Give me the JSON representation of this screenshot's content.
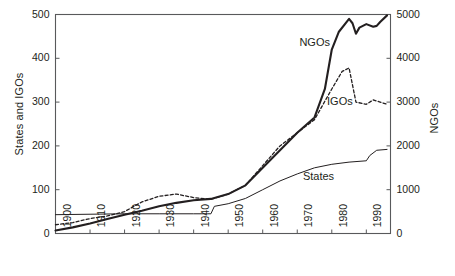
{
  "chart_data": {
    "type": "line",
    "title": "",
    "subtitle": "",
    "xlabel": "",
    "ylabel": "States and IGOs",
    "y2label": "NGOs",
    "grid": false,
    "legend_position": "inline-annotation",
    "xlim": [
      1900,
      1997
    ],
    "ylim": [
      0,
      500
    ],
    "y2lim": [
      0,
      5000
    ],
    "xticks": [
      "1900",
      "1910",
      "1920",
      "1930",
      "1940",
      "1950",
      "1960",
      "1970",
      "1980",
      "1990"
    ],
    "xtick_values": [
      1900,
      1910,
      1920,
      1930,
      1940,
      1950,
      1960,
      1970,
      1980,
      1990
    ],
    "yticks_left": [
      "0",
      "100",
      "200",
      "300",
      "400",
      "500"
    ],
    "ytick_left_values": [
      0,
      100,
      200,
      300,
      400,
      500
    ],
    "yticks_right": [
      "0",
      "1000",
      "2000",
      "3000",
      "4000",
      "5000"
    ],
    "ytick_right_values": [
      0,
      1000,
      2000,
      3000,
      4000,
      5000
    ],
    "annotations": [
      {
        "text": "NGOs",
        "x": 1977,
        "y_axis": "right",
        "y": 4350
      },
      {
        "text": "IGOs",
        "x": 1985,
        "y_axis": "left",
        "y": 300
      },
      {
        "text": "States",
        "x": 1978,
        "y_axis": "left",
        "y": 130
      }
    ],
    "series": [
      {
        "name": "States",
        "axis": "left",
        "style": "thin-solid",
        "color": "#231f20",
        "x": [
          1900,
          1910,
          1920,
          1930,
          1940,
          1944,
          1945,
          1946,
          1950,
          1955,
          1960,
          1965,
          1970,
          1975,
          1980,
          1985,
          1990,
          1991,
          1993,
          1996
        ],
        "values": [
          43,
          44,
          45,
          45,
          45,
          45,
          45,
          62,
          68,
          80,
          100,
          120,
          136,
          150,
          158,
          163,
          166,
          178,
          190,
          192
        ]
      },
      {
        "name": "IGOs",
        "axis": "left",
        "style": "dashed",
        "color": "#231f20",
        "x": [
          1900,
          1905,
          1910,
          1915,
          1920,
          1925,
          1930,
          1935,
          1940,
          1945,
          1950,
          1955,
          1960,
          1965,
          1970,
          1975,
          1980,
          1983,
          1985,
          1987,
          1990,
          1992,
          1994,
          1996
        ],
        "values": [
          20,
          25,
          34,
          40,
          50,
          72,
          85,
          90,
          82,
          78,
          90,
          110,
          155,
          200,
          230,
          260,
          330,
          370,
          378,
          300,
          295,
          305,
          300,
          295
        ]
      },
      {
        "name": "NGOs",
        "axis": "right",
        "style": "thick-solid",
        "color": "#231f20",
        "x": [
          1900,
          1905,
          1910,
          1915,
          1920,
          1925,
          1930,
          1935,
          1940,
          1945,
          1950,
          1955,
          1960,
          1965,
          1970,
          1975,
          1978,
          1980,
          1982,
          1985,
          1986,
          1987,
          1988,
          1990,
          1992,
          1993,
          1994,
          1996
        ],
        "values": [
          70,
          140,
          230,
          330,
          430,
          520,
          620,
          700,
          760,
          790,
          900,
          1100,
          1500,
          1900,
          2300,
          2650,
          3300,
          4200,
          4600,
          4900,
          4800,
          4560,
          4700,
          4780,
          4720,
          4740,
          4830,
          4980
        ]
      }
    ]
  },
  "axes": {
    "left_title": "States and IGOs",
    "right_title": "NGOs"
  },
  "annotations": {
    "ngos": "NGOs",
    "igos": "IGOs",
    "states": "States"
  }
}
